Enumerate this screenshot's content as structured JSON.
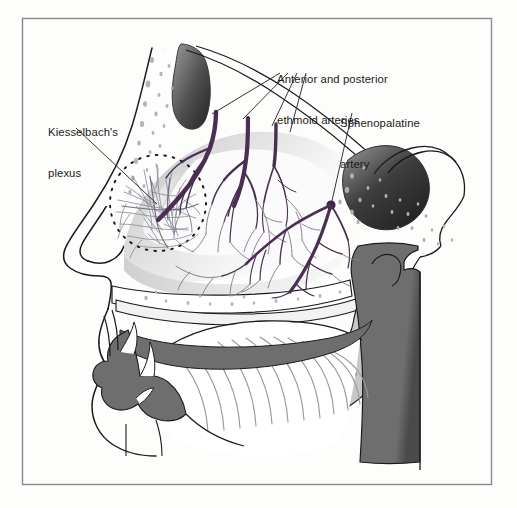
{
  "figure": {
    "frame": {
      "color": "#8a8a8a",
      "x": 22,
      "y": 18,
      "width": 470,
      "height": 467
    },
    "background": "#fdfdfc"
  },
  "labels": {
    "kiesselbach": {
      "line1": "Kiesselbach's",
      "line2": "plexus"
    },
    "ethmoid": {
      "line1": "Anterior and posterior",
      "line2": "ethmoid arteries"
    },
    "sphenopalatine": {
      "line1": "Sphenopalatine",
      "line2": "artery"
    }
  },
  "colors": {
    "artery": "#4a2f52",
    "artery_fine": "#6b5570",
    "outline": "#1b1b1b",
    "tissue_mid": "#707070",
    "tissue_dark": "#3a3a3a",
    "tissue_light": "#c9c9c9",
    "text": "#1b1b1b",
    "frame": "#8a8a8a"
  },
  "structures": [
    {
      "name": "frontal-sinus",
      "shading": "dark-gradient"
    },
    {
      "name": "sphenoid-sinus",
      "shading": "dark-gradient"
    },
    {
      "name": "nasal-turbinates",
      "shading": "light-gradient"
    },
    {
      "name": "kiesselbach-plexus-circle",
      "style": "dotted-outline"
    },
    {
      "name": "soft-palate",
      "shading": "mid-gray"
    },
    {
      "name": "tongue",
      "shading": "striated"
    },
    {
      "name": "hard-palate",
      "shading": "mid-gray"
    },
    {
      "name": "pharyngeal-wall",
      "shading": "mid-gray"
    },
    {
      "name": "nasal-dorsum",
      "shading": "outline"
    },
    {
      "name": "hyoid-mandible",
      "shading": "mid-gray"
    }
  ]
}
